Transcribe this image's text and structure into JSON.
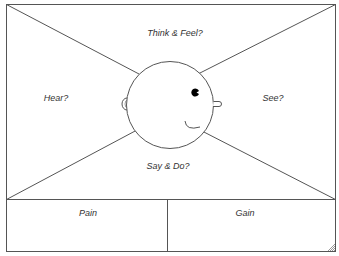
{
  "diagram": {
    "type": "empathy-map",
    "quadrants": {
      "top": "Think & Feel?",
      "left": "Hear?",
      "right": "See?",
      "bottom": "Say & Do?"
    },
    "bottom_panels": {
      "left": "Pain",
      "right": "Gain"
    },
    "head": {
      "icon": "face-profile-icon",
      "facing": "right"
    },
    "colors": {
      "line": "#555555",
      "text": "#333333",
      "background": "#ffffff",
      "grip": "#999999"
    }
  }
}
